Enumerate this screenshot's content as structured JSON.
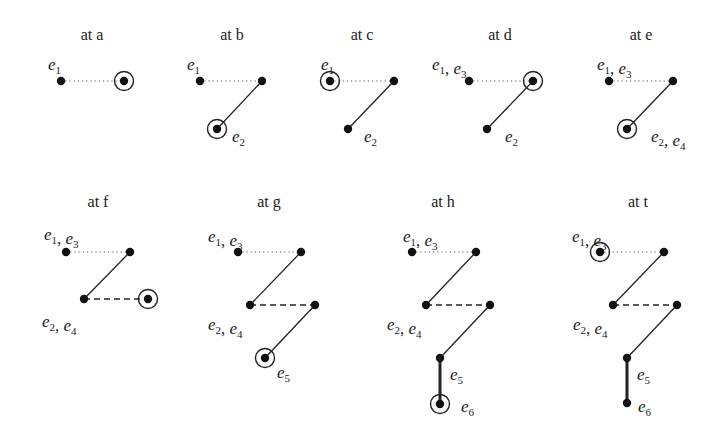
{
  "figure": {
    "background": "#ffffff",
    "ink": "#222222",
    "panels": [
      {
        "id": "a",
        "title": "at a",
        "tx": 92,
        "ty": 40,
        "nodes": [
          {
            "x": 61,
            "y": 81
          },
          {
            "x": 124,
            "y": 81,
            "circled": true
          }
        ],
        "edges": [
          {
            "from": 0,
            "to": 1,
            "style": "dotted"
          }
        ],
        "labels": [
          {
            "x": 48,
            "y": 70,
            "parts": [
              [
                "e",
                "1"
              ]
            ]
          }
        ]
      },
      {
        "id": "b",
        "title": "at b",
        "tx": 232,
        "ty": 40,
        "nodes": [
          {
            "x": 200,
            "y": 81
          },
          {
            "x": 262,
            "y": 81
          },
          {
            "x": 217,
            "y": 129,
            "circled": true
          }
        ],
        "edges": [
          {
            "from": 0,
            "to": 1,
            "style": "dotted"
          },
          {
            "from": 1,
            "to": 2,
            "style": "solid"
          }
        ],
        "labels": [
          {
            "x": 187,
            "y": 70,
            "parts": [
              [
                "e",
                "1"
              ]
            ]
          },
          {
            "x": 232,
            "y": 142,
            "parts": [
              [
                "e",
                "2"
              ]
            ]
          }
        ]
      },
      {
        "id": "c",
        "title": "at c",
        "tx": 362,
        "ty": 40,
        "nodes": [
          {
            "x": 330,
            "y": 81,
            "circled": true
          },
          {
            "x": 394,
            "y": 81
          },
          {
            "x": 348,
            "y": 129
          }
        ],
        "edges": [
          {
            "from": 0,
            "to": 1,
            "style": "dotted"
          },
          {
            "from": 1,
            "to": 2,
            "style": "solid"
          }
        ],
        "labels": [
          {
            "x": 321,
            "y": 70,
            "parts": [
              [
                "e",
                "1"
              ]
            ]
          },
          {
            "x": 364,
            "y": 142,
            "parts": [
              [
                "e",
                "2"
              ]
            ]
          }
        ]
      },
      {
        "id": "d",
        "title": "at d",
        "tx": 500,
        "ty": 40,
        "nodes": [
          {
            "x": 469,
            "y": 81
          },
          {
            "x": 533,
            "y": 81,
            "circled": true
          },
          {
            "x": 487,
            "y": 129
          }
        ],
        "edges": [
          {
            "from": 0,
            "to": 1,
            "style": "dotted"
          },
          {
            "from": 1,
            "to": 2,
            "style": "solid"
          }
        ],
        "labels": [
          {
            "x": 432,
            "y": 70,
            "parts": [
              [
                "e",
                "1"
              ],
              [
                "e",
                "3"
              ]
            ]
          },
          {
            "x": 505,
            "y": 142,
            "parts": [
              [
                "e",
                "2"
              ]
            ]
          }
        ]
      },
      {
        "id": "e",
        "title": "at e",
        "tx": 641,
        "ty": 40,
        "nodes": [
          {
            "x": 609,
            "y": 81
          },
          {
            "x": 673,
            "y": 81
          },
          {
            "x": 627,
            "y": 129,
            "circled": true
          }
        ],
        "edges": [
          {
            "from": 0,
            "to": 1,
            "style": "dotted"
          },
          {
            "from": 1,
            "to": 2,
            "style": "solid"
          }
        ],
        "labels": [
          {
            "x": 597,
            "y": 70,
            "parts": [
              [
                "e",
                "1"
              ],
              [
                "e",
                "3"
              ]
            ]
          },
          {
            "x": 651,
            "y": 142,
            "parts": [
              [
                "e",
                "2"
              ],
              [
                "e",
                "4"
              ]
            ]
          }
        ]
      },
      {
        "id": "f",
        "title": "at f",
        "tx": 98,
        "ty": 207,
        "nodes": [
          {
            "x": 66,
            "y": 252
          },
          {
            "x": 130,
            "y": 252
          },
          {
            "x": 84,
            "y": 299
          },
          {
            "x": 148,
            "y": 299,
            "circled": true
          }
        ],
        "edges": [
          {
            "from": 0,
            "to": 1,
            "style": "dotted"
          },
          {
            "from": 1,
            "to": 2,
            "style": "solid"
          },
          {
            "from": 2,
            "to": 3,
            "style": "dashed"
          }
        ],
        "labels": [
          {
            "x": 44,
            "y": 240,
            "parts": [
              [
                "e",
                "1"
              ],
              [
                "e",
                "3"
              ]
            ]
          },
          {
            "x": 42,
            "y": 327,
            "parts": [
              [
                "e",
                "2"
              ],
              [
                "e",
                "4"
              ]
            ]
          }
        ]
      },
      {
        "id": "g",
        "title": "at g",
        "tx": 269,
        "ty": 207,
        "nodes": [
          {
            "x": 238,
            "y": 252
          },
          {
            "x": 301,
            "y": 252
          },
          {
            "x": 250,
            "y": 305
          },
          {
            "x": 315,
            "y": 305
          },
          {
            "x": 265,
            "y": 358,
            "circled": true
          }
        ],
        "edges": [
          {
            "from": 0,
            "to": 1,
            "style": "dotted"
          },
          {
            "from": 1,
            "to": 2,
            "style": "solid"
          },
          {
            "from": 2,
            "to": 3,
            "style": "dashed"
          },
          {
            "from": 3,
            "to": 4,
            "style": "solid"
          }
        ],
        "labels": [
          {
            "x": 208,
            "y": 242,
            "parts": [
              [
                "e",
                "1"
              ],
              [
                "e",
                "3"
              ]
            ]
          },
          {
            "x": 208,
            "y": 330,
            "parts": [
              [
                "e",
                "2"
              ],
              [
                "e",
                "4"
              ]
            ]
          },
          {
            "x": 277,
            "y": 378,
            "parts": [
              [
                "e",
                "5"
              ]
            ]
          }
        ]
      },
      {
        "id": "h",
        "title": "at h",
        "tx": 443,
        "ty": 207,
        "nodes": [
          {
            "x": 412,
            "y": 252
          },
          {
            "x": 476,
            "y": 252
          },
          {
            "x": 426,
            "y": 305
          },
          {
            "x": 490,
            "y": 305
          },
          {
            "x": 440,
            "y": 358
          },
          {
            "x": 440,
            "y": 404,
            "circled": true
          }
        ],
        "edges": [
          {
            "from": 0,
            "to": 1,
            "style": "dotted"
          },
          {
            "from": 1,
            "to": 2,
            "style": "solid"
          },
          {
            "from": 2,
            "to": 3,
            "style": "dashed"
          },
          {
            "from": 3,
            "to": 4,
            "style": "solid"
          },
          {
            "from": 4,
            "to": 5,
            "style": "thick"
          }
        ],
        "labels": [
          {
            "x": 403,
            "y": 242,
            "parts": [
              [
                "e",
                "1"
              ],
              [
                "e",
                "3"
              ]
            ]
          },
          {
            "x": 387,
            "y": 330,
            "parts": [
              [
                "e",
                "2"
              ],
              [
                "e",
                "4"
              ]
            ]
          },
          {
            "x": 450,
            "y": 380,
            "parts": [
              [
                "e",
                "5"
              ]
            ]
          },
          {
            "x": 461,
            "y": 412,
            "parts": [
              [
                "e",
                "6"
              ]
            ]
          }
        ]
      },
      {
        "id": "t",
        "title": "at t",
        "tx": 638,
        "ty": 207,
        "nodes": [
          {
            "x": 600,
            "y": 252,
            "circled": true
          },
          {
            "x": 664,
            "y": 252
          },
          {
            "x": 613,
            "y": 305
          },
          {
            "x": 677,
            "y": 305
          },
          {
            "x": 627,
            "y": 358
          },
          {
            "x": 627,
            "y": 403
          }
        ],
        "edges": [
          {
            "from": 0,
            "to": 1,
            "style": "dotted"
          },
          {
            "from": 1,
            "to": 2,
            "style": "solid"
          },
          {
            "from": 2,
            "to": 3,
            "style": "dashed"
          },
          {
            "from": 3,
            "to": 4,
            "style": "solid"
          },
          {
            "from": 4,
            "to": 5,
            "style": "thick"
          }
        ],
        "labels": [
          {
            "x": 572,
            "y": 242,
            "parts": [
              [
                "e",
                "1"
              ],
              [
                "e",
                "3"
              ]
            ]
          },
          {
            "x": 573,
            "y": 330,
            "parts": [
              [
                "e",
                "2"
              ],
              [
                "e",
                "4"
              ]
            ]
          },
          {
            "x": 637,
            "y": 380,
            "parts": [
              [
                "e",
                "5"
              ]
            ]
          },
          {
            "x": 638,
            "y": 412,
            "parts": [
              [
                "e",
                "6"
              ]
            ]
          }
        ]
      }
    ]
  }
}
